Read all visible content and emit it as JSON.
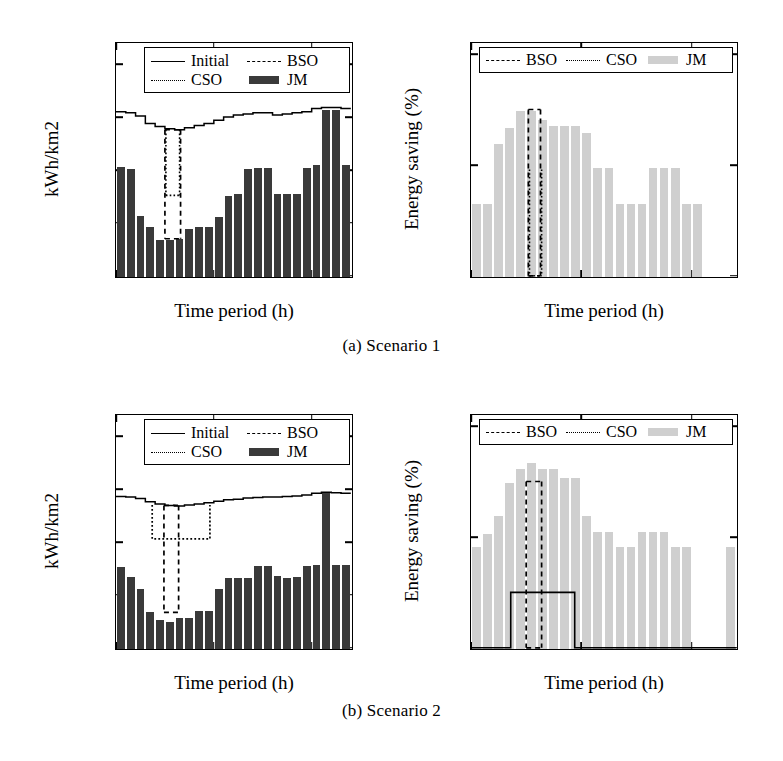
{
  "figure": {
    "captions": [
      {
        "id": "a",
        "text": "(a) Scenario 1"
      },
      {
        "id": "b",
        "text": "(b) Scenario 2"
      }
    ]
  },
  "colors": {
    "bar_dark": "#3a3a3a",
    "bar_light": "#cfcfcf",
    "line": "#000000",
    "background": "#ffffff"
  },
  "chart_data": [
    {
      "id": "s1-energy",
      "type": "bar",
      "panel": "Scenario 1 - left",
      "title": "",
      "xlabel": "Time period (h)",
      "ylabel": "kWh/km2",
      "xlim": [
        0,
        24
      ],
      "ylim": [
        0,
        22
      ],
      "xticks": [
        0,
        10,
        20
      ],
      "yticks": [
        0,
        5,
        10,
        15,
        20
      ],
      "grid": false,
      "legend_position": "top-inside",
      "legend": [
        {
          "name": "Initial",
          "style": "solid-line"
        },
        {
          "name": "BSO",
          "style": "dashed-line"
        },
        {
          "name": "CSO",
          "style": "dotted-line"
        },
        {
          "name": "JM",
          "style": "filled-bar-dark"
        }
      ],
      "x": [
        1,
        2,
        3,
        4,
        5,
        6,
        7,
        8,
        9,
        10,
        11,
        12,
        13,
        14,
        15,
        16,
        17,
        18,
        19,
        20,
        21,
        22,
        23,
        24
      ],
      "series": [
        {
          "name": "JM",
          "style": "bar",
          "values": [
            10.4,
            10.2,
            5.8,
            4.7,
            3.5,
            3.5,
            3.6,
            4.5,
            4.7,
            4.7,
            5.7,
            7.7,
            7.8,
            10.2,
            10.3,
            10.3,
            7.8,
            7.8,
            7.8,
            10.3,
            10.6,
            15.8,
            15.8,
            10.6
          ]
        },
        {
          "name": "Initial",
          "style": "step-line",
          "values": [
            15.5,
            15.4,
            15.1,
            14.4,
            14.1,
            13.9,
            13.8,
            14.0,
            14.2,
            14.4,
            14.7,
            15.0,
            15.2,
            15.3,
            15.4,
            15.4,
            15.2,
            15.3,
            15.4,
            15.5,
            15.8,
            15.9,
            15.9,
            15.8
          ]
        },
        {
          "name": "BSO",
          "style": "dashed-dip",
          "dip_start": 5.0,
          "dip_end": 6.6,
          "top": 13.8,
          "bottom": 3.5
        },
        {
          "name": "CSO",
          "style": "dotted-dip",
          "dip_start": 5.1,
          "dip_end": 6.5,
          "top": 13.8,
          "bottom": 7.6
        }
      ]
    },
    {
      "id": "s1-saving",
      "type": "bar",
      "panel": "Scenario 1 - right",
      "title": "",
      "xlabel": "Time period (h)",
      "ylabel": "Energy saving (%)",
      "xlim": [
        0,
        24
      ],
      "ylim": [
        0,
        105
      ],
      "xticks": [
        0,
        10,
        20
      ],
      "yticks": [
        0,
        50,
        100
      ],
      "grid": false,
      "legend_position": "top-inside",
      "legend": [
        {
          "name": "BSO",
          "style": "dashed-line"
        },
        {
          "name": "CSO",
          "style": "dotted-line"
        },
        {
          "name": "JM",
          "style": "filled-bar-light"
        }
      ],
      "x": [
        1,
        2,
        3,
        4,
        5,
        6,
        7,
        8,
        9,
        10,
        11,
        12,
        13,
        14,
        15,
        16,
        17,
        18,
        19,
        20,
        21,
        22,
        23,
        24
      ],
      "series": [
        {
          "name": "JM",
          "style": "bar",
          "values": [
            33,
            33,
            60,
            67,
            75,
            75,
            71,
            68,
            68,
            68,
            65,
            49,
            49,
            33,
            33,
            33,
            49,
            49,
            49,
            33,
            33,
            0,
            0,
            0
          ]
        },
        {
          "name": "BSO",
          "style": "dashed-dip",
          "dip_start": 5.2,
          "dip_end": 6.3,
          "top": 75,
          "bottom": 0
        },
        {
          "name": "CSO",
          "style": "dotted-dip",
          "dip_start": 5.3,
          "dip_end": 6.4,
          "top": 48,
          "bottom": 0
        }
      ]
    },
    {
      "id": "s2-energy",
      "type": "bar",
      "panel": "Scenario 2 - left",
      "title": "",
      "xlabel": "Time period (h)",
      "ylabel": "kWh/km2",
      "xlim": [
        0,
        24
      ],
      "ylim": [
        0,
        44
      ],
      "xticks": [
        0,
        10,
        20
      ],
      "yticks": [
        0,
        10,
        20,
        30,
        40
      ],
      "grid": false,
      "legend_position": "top-inside",
      "legend": [
        {
          "name": "Initial",
          "style": "solid-line"
        },
        {
          "name": "BSO",
          "style": "dashed-line"
        },
        {
          "name": "CSO",
          "style": "dotted-line"
        },
        {
          "name": "JM",
          "style": "filled-bar-dark"
        }
      ],
      "x": [
        1,
        2,
        3,
        4,
        5,
        6,
        7,
        8,
        9,
        10,
        11,
        12,
        13,
        14,
        15,
        16,
        17,
        18,
        19,
        20,
        21,
        22,
        23,
        24
      ],
      "series": [
        {
          "name": "JM",
          "style": "bar",
          "values": [
            15.5,
            13.7,
            11.3,
            7.0,
            5.4,
            5.1,
            5.8,
            5.9,
            7.1,
            7.1,
            11.3,
            13.4,
            13.5,
            13.5,
            15.6,
            15.6,
            13.8,
            13.5,
            13.6,
            15.6,
            15.9,
            29.4,
            15.9,
            15.8
          ]
        },
        {
          "name": "Initial",
          "style": "step-line",
          "values": [
            28.6,
            28.5,
            28.2,
            27.6,
            27.2,
            26.9,
            26.8,
            27.0,
            27.2,
            27.4,
            27.7,
            28.0,
            28.1,
            28.3,
            28.4,
            28.5,
            28.5,
            28.6,
            28.7,
            28.9,
            29.2,
            29.4,
            29.3,
            29.2
          ]
        },
        {
          "name": "BSO",
          "style": "dashed-dip",
          "dip_start": 4.9,
          "dip_end": 6.4,
          "top": 26.9,
          "bottom": 6.7
        },
        {
          "name": "CSO",
          "style": "dotted-trapezoid",
          "start": 3.7,
          "end": 9.6,
          "top": 27.0,
          "bottom": 20.6
        }
      ]
    },
    {
      "id": "s2-saving",
      "type": "bar",
      "panel": "Scenario 2 - right",
      "title": "",
      "xlabel": "Time period (h)",
      "ylabel": "Energy saving (%)",
      "xlim": [
        0,
        24
      ],
      "ylim": [
        0,
        105
      ],
      "xticks": [
        0,
        10,
        20
      ],
      "yticks": [
        0,
        50,
        100
      ],
      "grid": false,
      "legend_position": "top-inside",
      "legend": [
        {
          "name": "BSO",
          "style": "dashed-line"
        },
        {
          "name": "CSO",
          "style": "dotted-line"
        },
        {
          "name": "JM",
          "style": "filled-bar-light"
        }
      ],
      "x": [
        1,
        2,
        3,
        4,
        5,
        6,
        7,
        8,
        9,
        10,
        11,
        12,
        13,
        14,
        15,
        16,
        17,
        18,
        19,
        20,
        21,
        22,
        23,
        24
      ],
      "series": [
        {
          "name": "JM",
          "style": "bar",
          "values": [
            46,
            52,
            60,
            75,
            81,
            84,
            81,
            81,
            77,
            77,
            60,
            53,
            53,
            46,
            46,
            53,
            53,
            53,
            46,
            46,
            0,
            0,
            0,
            46
          ]
        },
        {
          "name": "BSO",
          "style": "dashed-dip",
          "dip_start": 5.0,
          "dip_end": 6.4,
          "top": 75,
          "bottom": 0
        },
        {
          "name": "CSO",
          "style": "step-plateau",
          "start": 3.6,
          "end": 9.4,
          "level": 25,
          "base": 0
        }
      ]
    }
  ]
}
